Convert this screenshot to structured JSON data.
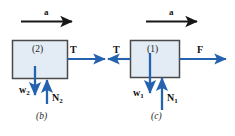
{
  "figure": {
    "type": "free-body-diagram",
    "colors": {
      "arrow_blue": "#2563b0",
      "accel_arrow_black": "#171717",
      "box_fill": "#e3ecf5",
      "box_stroke": "#4a4a4a",
      "background": "#ffffff",
      "text": "#1a1a1a"
    },
    "panels": [
      {
        "id": "panel-b",
        "caption": "(b)",
        "body_label": "(2)",
        "accel_label": "a",
        "forces": [
          {
            "name": "tension-right",
            "label": "T",
            "sub": "",
            "direction": "right"
          },
          {
            "name": "weight",
            "label": "w",
            "sub": "2",
            "direction": "down"
          },
          {
            "name": "normal",
            "label": "N",
            "sub": "2",
            "direction": "up"
          }
        ]
      },
      {
        "id": "panel-c",
        "caption": "(c)",
        "body_label": "(1)",
        "accel_label": "a",
        "forces": [
          {
            "name": "tension-left",
            "label": "T",
            "sub": "",
            "direction": "left"
          },
          {
            "name": "applied-force",
            "label": "F",
            "sub": "",
            "direction": "right"
          },
          {
            "name": "weight",
            "label": "w",
            "sub": "1",
            "direction": "down"
          },
          {
            "name": "normal",
            "label": "N",
            "sub": "1",
            "direction": "up"
          }
        ]
      }
    ],
    "labels": {
      "accel_b": "a",
      "accel_c": "a",
      "body_b": "(2)",
      "body_c": "(1)",
      "tension_b": "T",
      "tension_c": "T",
      "force_f": "F",
      "weight_b": "w",
      "weight_b_sub": "2",
      "normal_b": "N",
      "normal_b_sub": "2",
      "weight_c": "w",
      "weight_c_sub": "1",
      "normal_c": "N",
      "normal_c_sub": "1",
      "caption_b": "(b)",
      "caption_c": "(c)"
    }
  }
}
